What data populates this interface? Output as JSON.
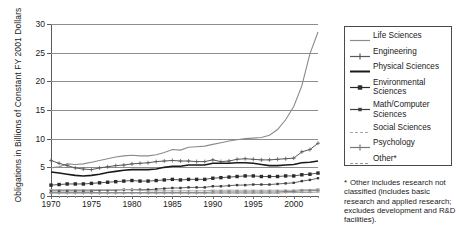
{
  "chart_data": {
    "type": "line",
    "title": "",
    "xlabel": "",
    "ylabel": "Obligations in Billions of Constant FY 2001 Dollars",
    "xlim": [
      1970,
      2003
    ],
    "ylim": [
      0,
      30
    ],
    "yticks": [
      0,
      5,
      10,
      15,
      20,
      25,
      30
    ],
    "xticks": [
      1970,
      1975,
      1980,
      1985,
      1990,
      1995,
      2000
    ],
    "grid": "horizontal",
    "legend_position": "right",
    "x": [
      1970,
      1971,
      1972,
      1973,
      1974,
      1975,
      1976,
      1977,
      1978,
      1979,
      1980,
      1981,
      1982,
      1983,
      1984,
      1985,
      1986,
      1987,
      1988,
      1989,
      1990,
      1991,
      1992,
      1993,
      1994,
      1995,
      1996,
      1997,
      1998,
      1999,
      2000,
      2001,
      2002,
      2003
    ],
    "series": [
      {
        "name": "Life Sciences",
        "color": "#8a8a8a",
        "values": [
          4.9,
          5.1,
          5.6,
          5.5,
          5.6,
          5.9,
          6.2,
          6.5,
          6.8,
          7.0,
          7.1,
          7.0,
          7.0,
          7.2,
          7.6,
          8.1,
          8.0,
          8.5,
          8.6,
          8.7,
          9.0,
          9.3,
          9.6,
          9.8,
          10.0,
          10.1,
          10.2,
          10.6,
          11.6,
          13.3,
          15.6,
          19.2,
          24.8,
          28.6
        ]
      },
      {
        "name": "Engineering",
        "color": "#595959",
        "values": [
          6.2,
          5.7,
          5.3,
          4.9,
          4.7,
          4.6,
          4.9,
          5.1,
          5.3,
          5.4,
          5.6,
          5.7,
          5.8,
          6.0,
          6.1,
          6.2,
          6.1,
          6.1,
          6.0,
          6.0,
          6.3,
          6.0,
          6.1,
          6.4,
          6.5,
          6.4,
          6.3,
          6.3,
          6.4,
          6.5,
          6.6,
          7.7,
          8.1,
          9.2
        ]
      },
      {
        "name": "Physical Sciences",
        "color": "#1a1a1a",
        "values": [
          4.2,
          4.0,
          3.8,
          3.6,
          3.5,
          3.6,
          3.8,
          4.1,
          4.3,
          4.5,
          4.6,
          4.6,
          4.6,
          4.7,
          5.0,
          5.2,
          5.2,
          5.4,
          5.4,
          5.4,
          5.7,
          5.7,
          5.7,
          5.8,
          5.8,
          5.7,
          5.5,
          5.3,
          5.3,
          5.4,
          5.5,
          5.8,
          5.9,
          6.1
        ]
      },
      {
        "name": "Environmental Sciences",
        "color": "#2b2b2b",
        "values": [
          1.9,
          2.0,
          2.1,
          2.1,
          2.1,
          2.2,
          2.3,
          2.4,
          2.5,
          2.6,
          2.7,
          2.6,
          2.6,
          2.7,
          2.8,
          2.9,
          2.8,
          2.9,
          2.9,
          2.9,
          3.1,
          3.2,
          3.3,
          3.4,
          3.5,
          3.5,
          3.4,
          3.4,
          3.4,
          3.5,
          3.5,
          3.7,
          3.8,
          4.0
        ]
      },
      {
        "name": "Math/Computer Sciences",
        "color": "#3d3d3d",
        "values": [
          0.9,
          0.9,
          0.9,
          0.9,
          0.9,
          0.9,
          1.0,
          1.0,
          1.0,
          1.1,
          1.1,
          1.1,
          1.1,
          1.2,
          1.3,
          1.4,
          1.4,
          1.5,
          1.5,
          1.5,
          1.7,
          1.7,
          1.8,
          1.9,
          1.9,
          2.0,
          2.0,
          2.0,
          2.1,
          2.2,
          2.3,
          2.6,
          2.8,
          3.1
        ]
      },
      {
        "name": "Social Sciences",
        "color": "#a8a8a8",
        "values": [
          1.1,
          1.1,
          1.1,
          1.1,
          1.1,
          1.1,
          1.1,
          1.1,
          1.1,
          1.1,
          1.1,
          1.0,
          0.9,
          0.9,
          0.9,
          0.9,
          0.9,
          0.9,
          0.9,
          0.9,
          1.0,
          1.0,
          1.0,
          1.0,
          1.0,
          1.0,
          1.0,
          1.0,
          1.0,
          1.0,
          1.0,
          1.1,
          1.1,
          1.2
        ]
      },
      {
        "name": "Psychology",
        "color": "#777777",
        "values": [
          0.6,
          0.6,
          0.6,
          0.6,
          0.6,
          0.6,
          0.6,
          0.6,
          0.6,
          0.6,
          0.6,
          0.6,
          0.6,
          0.6,
          0.6,
          0.6,
          0.6,
          0.6,
          0.6,
          0.6,
          0.7,
          0.7,
          0.7,
          0.7,
          0.7,
          0.7,
          0.7,
          0.7,
          0.7,
          0.8,
          0.8,
          0.9,
          0.9,
          1.0
        ]
      },
      {
        "name": "Other*",
        "color": "#9a9a9a",
        "values": [
          0.5,
          0.5,
          0.5,
          0.5,
          0.5,
          0.5,
          0.5,
          0.5,
          0.5,
          0.5,
          0.5,
          0.5,
          0.5,
          0.5,
          0.5,
          0.5,
          0.5,
          0.5,
          0.5,
          0.5,
          0.5,
          0.5,
          0.5,
          0.5,
          0.5,
          0.5,
          0.5,
          0.5,
          0.5,
          0.6,
          0.6,
          0.6,
          0.6,
          0.7
        ]
      }
    ]
  },
  "legend": {
    "items": [
      {
        "label": "Life Sciences",
        "marker": "line-plain"
      },
      {
        "label": "Engineering",
        "marker": "line-plus"
      },
      {
        "label": "Physical Sciences",
        "marker": "line-thick"
      },
      {
        "label": "Environmental Sciences",
        "marker": "square-marker"
      },
      {
        "label": "Math/Computer Sciences",
        "marker": "square-small-marker"
      },
      {
        "label": "Social Sciences",
        "marker": "line-light-dash"
      },
      {
        "label": "Psychology",
        "marker": "line-cross"
      },
      {
        "label": "Other*",
        "marker": "line-dash"
      }
    ]
  },
  "footnote": {
    "star": "*",
    "text": "Other includes research not classified (includes basic research and applied research; excludes development and R&D facilities)."
  }
}
